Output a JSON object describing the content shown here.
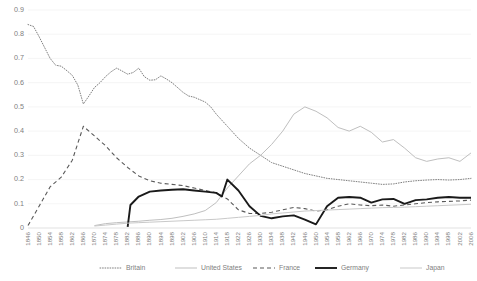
{
  "chart_data": {
    "type": "line",
    "title": "",
    "xlabel": "",
    "ylabel": "",
    "ylim": [
      0,
      0.9
    ],
    "ytick_labels": [
      "0",
      "0.1",
      "0.2",
      "0.3",
      "0.4",
      "0.5",
      "0.6",
      "0.7",
      "0.8",
      "0.9"
    ],
    "ytick_values": [
      0,
      0.1,
      0.2,
      0.3,
      0.4,
      0.5,
      0.6,
      0.7,
      0.8,
      0.9
    ],
    "grid": true,
    "legend_position": "bottom",
    "x": [
      1846,
      1850,
      1854,
      1858,
      1862,
      1866,
      1870,
      1874,
      1878,
      1882,
      1886,
      1890,
      1894,
      1898,
      1902,
      1906,
      1910,
      1914,
      1918,
      1922,
      1926,
      1930,
      1934,
      1938,
      1942,
      1946,
      1950,
      1954,
      1958,
      1962,
      1966,
      1970,
      1974,
      1978,
      1982,
      1986,
      1990,
      1994,
      1998,
      2002,
      2006
    ],
    "x_step_years": 4,
    "series": [
      {
        "name": "Britain",
        "style": "dotted",
        "color": "#7f7f7f",
        "values_by_year": {
          "1846": 0.84,
          "1848": 0.832,
          "1850": 0.79,
          "1852": 0.745,
          "1854": 0.7,
          "1856": 0.672,
          "1858": 0.668,
          "1860": 0.65,
          "1862": 0.63,
          "1864": 0.59,
          "1866": 0.512,
          "1868": 0.545,
          "1870": 0.58,
          "1872": 0.6,
          "1874": 0.625,
          "1876": 0.645,
          "1878": 0.66,
          "1880": 0.648,
          "1882": 0.635,
          "1884": 0.642,
          "1886": 0.66,
          "1888": 0.625,
          "1890": 0.61,
          "1892": 0.612,
          "1894": 0.628,
          "1896": 0.615,
          "1898": 0.6,
          "1900": 0.58,
          "1902": 0.56,
          "1904": 0.545,
          "1906": 0.54,
          "1908": 0.53,
          "1910": 0.52,
          "1912": 0.5,
          "1914": 0.47,
          "1918": 0.42,
          "1922": 0.37,
          "1926": 0.33,
          "1930": 0.3,
          "1934": 0.27,
          "1938": 0.255,
          "1942": 0.24,
          "1946": 0.225,
          "1950": 0.215,
          "1954": 0.205,
          "1958": 0.2,
          "1962": 0.195,
          "1966": 0.19,
          "1970": 0.185,
          "1974": 0.18,
          "1978": 0.182,
          "1982": 0.19,
          "1986": 0.195,
          "1990": 0.198,
          "1994": 0.2,
          "1998": 0.198,
          "2002": 0.2,
          "2006": 0.205
        }
      },
      {
        "name": "United States",
        "style": "solid-thin",
        "color": "#bfbfbf",
        "values_by_year": {
          "1870": 0.01,
          "1874": 0.018,
          "1878": 0.022,
          "1882": 0.025,
          "1886": 0.028,
          "1890": 0.032,
          "1894": 0.035,
          "1898": 0.04,
          "1902": 0.048,
          "1906": 0.058,
          "1910": 0.072,
          "1914": 0.105,
          "1918": 0.165,
          "1922": 0.215,
          "1926": 0.265,
          "1930": 0.3,
          "1934": 0.345,
          "1938": 0.4,
          "1942": 0.47,
          "1946": 0.5,
          "1950": 0.482,
          "1954": 0.455,
          "1958": 0.415,
          "1962": 0.4,
          "1966": 0.42,
          "1970": 0.395,
          "1974": 0.355,
          "1978": 0.365,
          "1982": 0.33,
          "1986": 0.29,
          "1990": 0.275,
          "1994": 0.285,
          "1998": 0.29,
          "2002": 0.275,
          "2006": 0.31
        }
      },
      {
        "name": "France",
        "style": "dashed",
        "color": "#595959",
        "values_by_year": {
          "1846": 0.01,
          "1850": 0.09,
          "1854": 0.17,
          "1858": 0.21,
          "1862": 0.28,
          "1866": 0.42,
          "1870": 0.38,
          "1874": 0.34,
          "1878": 0.29,
          "1882": 0.25,
          "1886": 0.215,
          "1890": 0.195,
          "1894": 0.185,
          "1898": 0.18,
          "1902": 0.175,
          "1906": 0.165,
          "1910": 0.155,
          "1914": 0.145,
          "1918": 0.12,
          "1922": 0.075,
          "1926": 0.06,
          "1930": 0.06,
          "1934": 0.065,
          "1938": 0.075,
          "1942": 0.085,
          "1946": 0.08,
          "1950": 0.07,
          "1954": 0.075,
          "1958": 0.09,
          "1962": 0.1,
          "1966": 0.095,
          "1970": 0.092,
          "1974": 0.095,
          "1978": 0.09,
          "1982": 0.095,
          "1986": 0.1,
          "1990": 0.105,
          "1994": 0.108,
          "1998": 0.11,
          "2002": 0.112,
          "2006": 0.115
        }
      },
      {
        "name": "Germany",
        "style": "solid-thick",
        "color": "#1a1a1a",
        "values_by_year": {
          "1882": 0.005,
          "1883": 0.095,
          "1886": 0.13,
          "1890": 0.15,
          "1894": 0.155,
          "1898": 0.158,
          "1902": 0.16,
          "1906": 0.155,
          "1910": 0.15,
          "1914": 0.145,
          "1916": 0.13,
          "1918": 0.2,
          "1922": 0.155,
          "1926": 0.09,
          "1930": 0.05,
          "1934": 0.04,
          "1938": 0.048,
          "1942": 0.052,
          "1946": 0.035,
          "1950": 0.015,
          "1954": 0.09,
          "1958": 0.125,
          "1962": 0.128,
          "1966": 0.125,
          "1970": 0.105,
          "1974": 0.118,
          "1978": 0.12,
          "1982": 0.1,
          "1986": 0.115,
          "1990": 0.118,
          "1994": 0.125,
          "1998": 0.128,
          "2002": 0.125,
          "2006": 0.125
        }
      },
      {
        "name": "Japan",
        "style": "solid-light",
        "color": "#c9c9c9",
        "values_by_year": {
          "1870": 0.008,
          "1874": 0.012,
          "1878": 0.016,
          "1882": 0.02,
          "1886": 0.022,
          "1890": 0.024,
          "1894": 0.026,
          "1898": 0.028,
          "1902": 0.03,
          "1906": 0.032,
          "1910": 0.034,
          "1914": 0.036,
          "1918": 0.04,
          "1922": 0.044,
          "1926": 0.048,
          "1930": 0.052,
          "1934": 0.058,
          "1938": 0.062,
          "1942": 0.066,
          "1946": 0.07,
          "1950": 0.072,
          "1954": 0.074,
          "1958": 0.076,
          "1962": 0.078,
          "1966": 0.08,
          "1970": 0.082,
          "1974": 0.084,
          "1978": 0.085,
          "1982": 0.086,
          "1986": 0.088,
          "1990": 0.09,
          "1994": 0.092,
          "1998": 0.094,
          "2002": 0.096,
          "2006": 0.098
        }
      }
    ],
    "legend": [
      {
        "label": "Britain",
        "style": "dotted",
        "color": "#7f7f7f"
      },
      {
        "label": "United States",
        "style": "solid-thin",
        "color": "#bfbfbf"
      },
      {
        "label": "France",
        "style": "dashed",
        "color": "#595959"
      },
      {
        "label": "Germany",
        "style": "solid-thick",
        "color": "#1a1a1a"
      },
      {
        "label": "Japan",
        "style": "solid-light",
        "color": "#c9c9c9"
      }
    ]
  }
}
